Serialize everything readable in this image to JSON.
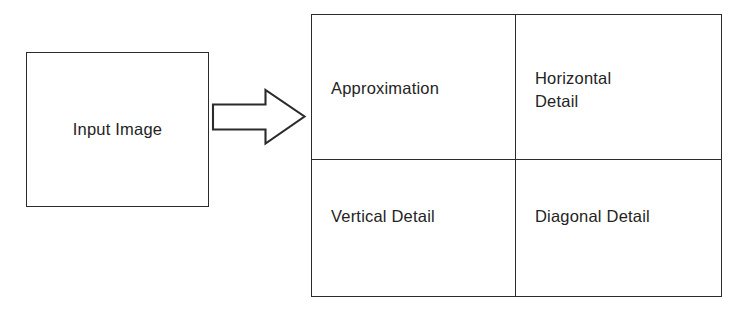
{
  "diagram": {
    "stroke_color": "#2b2b2b",
    "text_color": "#242424",
    "background_color": "#ffffff",
    "input": {
      "label": "Input Image"
    },
    "arrow": {
      "name": "right-block-arrow",
      "direction": "right"
    },
    "subbands": {
      "approximation": "Approximation",
      "horizontal": "Horizontal\nDetail",
      "vertical": "Vertical   Detail",
      "diagonal": "Diagonal Detail"
    }
  }
}
